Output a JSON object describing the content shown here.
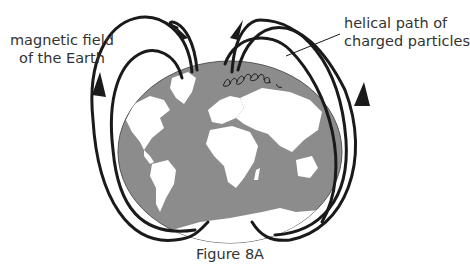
{
  "figure": {
    "caption": "Figure 8A",
    "labels": {
      "field_line1": "magnetic field",
      "field_line2": "of the Earth",
      "helix_line1": "helical path of",
      "helix_line2": "charged particles"
    },
    "colors": {
      "ocean": "#8c8c8c",
      "land": "#ffffff",
      "field_lines": "#1a1a1a",
      "text": "#333333"
    }
  }
}
